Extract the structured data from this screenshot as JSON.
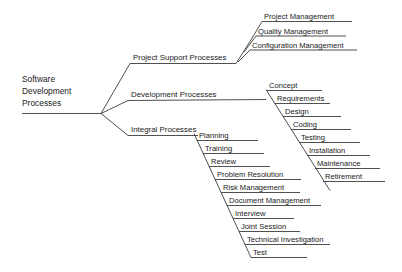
{
  "diagram": {
    "type": "fishbone-tree",
    "root": {
      "label_lines": [
        "Software",
        "Development",
        "Processes"
      ],
      "label": "Software Development Processes"
    },
    "branches": [
      {
        "id": "project-support-processes",
        "label": "Project Support Processes",
        "items": [
          "Project Management",
          "Quality Management",
          "Configuration Management"
        ]
      },
      {
        "id": "development-processes",
        "label": "Development Processes",
        "items": [
          "Concept",
          "Requirements",
          "Design",
          "Coding",
          "Testing",
          "Installation",
          "Maintenance",
          "Retirement"
        ]
      },
      {
        "id": "integral-processes",
        "label": "Integral Processes",
        "items": [
          "Planning",
          "Training",
          "Review",
          "Problem Resolution",
          "Risk Management",
          "Document Management",
          "Interview",
          "Joint Session",
          "Technical Investigation",
          "Test"
        ]
      }
    ],
    "colors": {
      "background": "#ffffff",
      "line": "#3c3c3c",
      "text": "#1a1a1a"
    }
  }
}
